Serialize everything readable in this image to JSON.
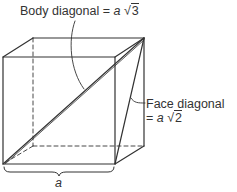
{
  "diagram": {
    "body_diagonal": {
      "label": "Body diagonal",
      "equals": "=",
      "variable": "a",
      "radical": "√",
      "radicand": "3"
    },
    "face_diagonal": {
      "label": "Face diagonal",
      "equals": "=",
      "variable": "a",
      "radical": "√",
      "radicand": "2"
    },
    "edge_label": "a",
    "colors": {
      "line": "#333333",
      "background": "#ffffff"
    }
  }
}
